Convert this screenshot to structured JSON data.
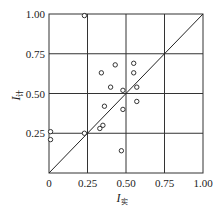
{
  "chart_data": {
    "type": "scatter",
    "title": "",
    "xlabel": "I",
    "xlabel_sub": "实",
    "ylabel": "I",
    "ylabel_sub": "计",
    "xlim": [
      0,
      1.0
    ],
    "ylim": [
      0,
      1.0
    ],
    "grid": true,
    "xticks": [
      "0",
      "0.25",
      "0.50",
      "0.75",
      "1.00"
    ],
    "yticks": [
      "0.25",
      "0.50",
      "0.75",
      "1.00"
    ],
    "reference_line": {
      "type": "y=x",
      "from": [
        0,
        0
      ],
      "to": [
        1,
        1
      ]
    },
    "series": [
      {
        "name": "data",
        "marker": "open-circle",
        "points": [
          {
            "x": 0.23,
            "y": 0.99
          },
          {
            "x": 0.43,
            "y": 0.68
          },
          {
            "x": 0.55,
            "y": 0.69
          },
          {
            "x": 0.34,
            "y": 0.63
          },
          {
            "x": 0.55,
            "y": 0.63
          },
          {
            "x": 0.4,
            "y": 0.54
          },
          {
            "x": 0.48,
            "y": 0.52
          },
          {
            "x": 0.57,
            "y": 0.54
          },
          {
            "x": 0.36,
            "y": 0.42
          },
          {
            "x": 0.57,
            "y": 0.45
          },
          {
            "x": 0.48,
            "y": 0.4
          },
          {
            "x": 0.35,
            "y": 0.3
          },
          {
            "x": 0.33,
            "y": 0.28
          },
          {
            "x": 0.23,
            "y": 0.25
          },
          {
            "x": 0.01,
            "y": 0.26
          },
          {
            "x": 0.01,
            "y": 0.21
          },
          {
            "x": 0.47,
            "y": 0.14
          }
        ]
      }
    ]
  },
  "colors": {
    "axis": "#333333",
    "grid": "#333333",
    "marker": "#333333",
    "background": "#ffffff"
  }
}
